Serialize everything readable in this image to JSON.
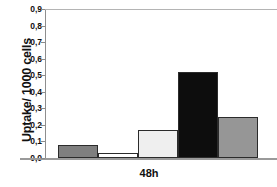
{
  "chart_data": {
    "type": "bar",
    "title": "",
    "xlabel": "48h",
    "ylabel": "Uptake/ 1000 cells",
    "ylim": [
      0,
      0.9
    ],
    "grid": false,
    "legend": "none",
    "categories": [
      "bar-1",
      "bar-2",
      "bar-3",
      "bar-4",
      "bar-5"
    ],
    "values": [
      0.08,
      0.03,
      0.17,
      0.52,
      0.25
    ],
    "y_ticks": [
      {
        "value": 0.0,
        "label": "0,0"
      },
      {
        "value": 0.1,
        "label": "0,1"
      },
      {
        "value": 0.2,
        "label": "0,2"
      },
      {
        "value": 0.3,
        "label": "0,3"
      },
      {
        "value": 0.4,
        "label": "0,4"
      },
      {
        "value": 0.5,
        "label": "0,5"
      },
      {
        "value": 0.6,
        "label": "0,6"
      },
      {
        "value": 0.7,
        "label": "0,7"
      },
      {
        "value": 0.8,
        "label": "0,8"
      },
      {
        "value": 0.9,
        "label": "0,9"
      }
    ],
    "x_tick_labels": [
      "48h"
    ],
    "bar_colors": [
      "#7f7f7f",
      "#ffffff",
      "#efefef",
      "#0d0d0d",
      "#969696"
    ],
    "bar_edge_color": "#2b2b2b",
    "axis_color": "#8e8e8e",
    "background_color": "#ffffff"
  }
}
